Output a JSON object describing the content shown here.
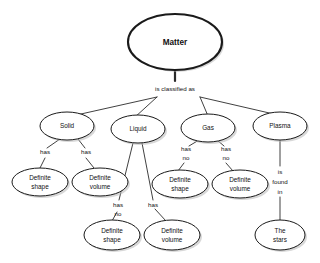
{
  "diagram": {
    "background_color": "#ffffff",
    "node_fill": "#ffffff",
    "node_stroke": "#1a1a1a",
    "text_color": "#111111",
    "root": {
      "label": "Matter"
    },
    "root_link_label": "is classified as",
    "states": [
      {
        "label": "Solid"
      },
      {
        "label": "Liquid"
      },
      {
        "label": "Gas"
      },
      {
        "label": "Plasma"
      }
    ],
    "solid_links": [
      {
        "label": "has"
      },
      {
        "label": "has"
      }
    ],
    "solid_properties": [
      {
        "line1": "Definite",
        "line2": "shape"
      },
      {
        "line1": "Definite",
        "line2": "volume"
      }
    ],
    "liquid_links": [
      {
        "line1": "has",
        "line2": "no"
      },
      {
        "line1": "has",
        "line2": ""
      }
    ],
    "liquid_properties": [
      {
        "line1": "Definite",
        "line2": "shape"
      },
      {
        "line1": "Definite",
        "line2": "volume"
      }
    ],
    "gas_links": [
      {
        "line1": "has",
        "line2": "no"
      },
      {
        "line1": "has",
        "line2": "no"
      }
    ],
    "gas_properties": [
      {
        "line1": "Definite",
        "line2": "shape"
      },
      {
        "line1": "Definite",
        "line2": "volume"
      }
    ],
    "plasma_link": {
      "line1": "is",
      "line2": "found",
      "line3": "in"
    },
    "plasma_property": {
      "line1": "The",
      "line2": "stars"
    }
  }
}
